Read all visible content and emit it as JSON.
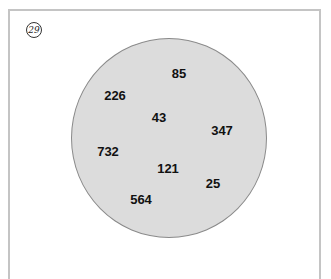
{
  "badge": {
    "label": "29"
  },
  "set": {
    "numbers": [
      {
        "value": "85",
        "x": 179,
        "y": 73
      },
      {
        "value": "226",
        "x": 115,
        "y": 95
      },
      {
        "value": "43",
        "x": 159,
        "y": 117
      },
      {
        "value": "347",
        "x": 222,
        "y": 130
      },
      {
        "value": "732",
        "x": 108,
        "y": 151
      },
      {
        "value": "121",
        "x": 168,
        "y": 168
      },
      {
        "value": "25",
        "x": 213,
        "y": 183
      },
      {
        "value": "564",
        "x": 141,
        "y": 199
      }
    ],
    "fill_color": "#dcdcdc",
    "border_color": "#8a8a8a"
  }
}
